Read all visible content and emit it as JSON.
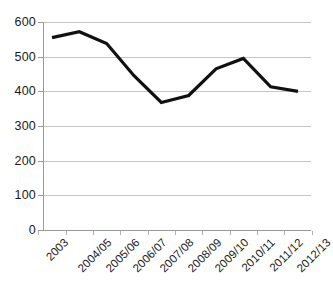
{
  "chart_data": {
    "type": "line",
    "title": "",
    "xlabel": "",
    "ylabel": "",
    "categories": [
      "2003",
      "2004/05",
      "2005/06",
      "2006/07",
      "2007/08",
      "2008/09",
      "2009/10",
      "2010/11",
      "2011/12",
      "2012/13"
    ],
    "values": [
      555,
      572,
      538,
      445,
      368,
      388,
      465,
      495,
      413,
      400
    ],
    "series": [
      {
        "name": "",
        "values": [
          555,
          572,
          538,
          445,
          368,
          388,
          465,
          495,
          413,
          400
        ]
      }
    ],
    "ylim": [
      0,
      600
    ],
    "ytick_labels": [
      "600",
      "500",
      "400",
      "300",
      "200",
      "100",
      "0"
    ],
    "ytick_values": [
      600,
      500,
      400,
      300,
      200,
      100,
      0
    ],
    "grid": true,
    "grid_axis": "y",
    "legend": "none",
    "line_color": "#111111",
    "grid_color": "#c6c6c6",
    "axis_color": "#9a9a9a",
    "background": "#ffffff",
    "xtick_label_rotation": -45
  }
}
